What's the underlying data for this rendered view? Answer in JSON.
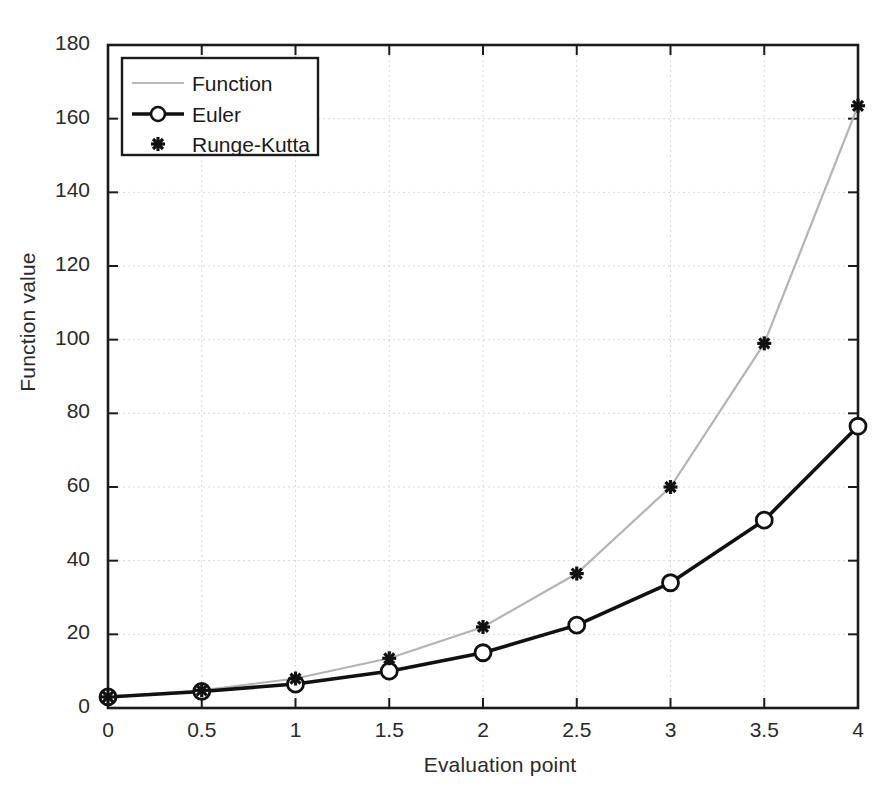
{
  "chart_data": {
    "type": "line",
    "title": "",
    "xlabel": "Evaluation point",
    "ylabel": "Function value",
    "xlim": [
      0,
      4
    ],
    "ylim": [
      0,
      180
    ],
    "xticks": [
      "0",
      "0.5",
      "1",
      "1.5",
      "2",
      "2.5",
      "3",
      "3.5",
      "4"
    ],
    "yticks": [
      "0",
      "20",
      "40",
      "60",
      "80",
      "100",
      "120",
      "140",
      "160",
      "180"
    ],
    "x": [
      0,
      0.5,
      1,
      1.5,
      2,
      2.5,
      3,
      3.5,
      4
    ],
    "grid": true,
    "legend_position": "top-left",
    "series": [
      {
        "name": "Function",
        "style": "line",
        "color": "#b4b4b4",
        "values": [
          3,
          4.8,
          8,
          13.5,
          22,
          36.5,
          60,
          99,
          163.5
        ]
      },
      {
        "name": "Euler",
        "style": "line-marker-circle",
        "color": "#111111",
        "values": [
          3,
          4.5,
          6.5,
          10,
          15,
          22.5,
          34,
          51,
          76.5
        ]
      },
      {
        "name": "Runge-Kutta",
        "style": "marker-asterisk",
        "color": "#111111",
        "values": [
          3,
          4.8,
          8,
          13.5,
          22,
          36.5,
          60,
          99,
          163.5
        ]
      }
    ]
  },
  "legend": {
    "entries": [
      {
        "label": "Function"
      },
      {
        "label": "Euler"
      },
      {
        "label": "Runge-Kutta"
      }
    ]
  },
  "axes": {
    "x_title": "Evaluation point",
    "y_title": "Function value"
  }
}
